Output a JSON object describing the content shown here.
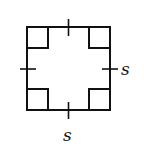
{
  "diagram": {
    "type": "square-with-right-angle-markers",
    "stroke_color": "#111111",
    "background": "#ffffff",
    "square": {
      "x": 27,
      "y": 27,
      "size": 83
    },
    "right_angle_marker_size": 21,
    "labels": {
      "right_side": "s",
      "bottom_side": "s"
    },
    "congruence_ticks": [
      "top",
      "right",
      "bottom",
      "left"
    ]
  }
}
